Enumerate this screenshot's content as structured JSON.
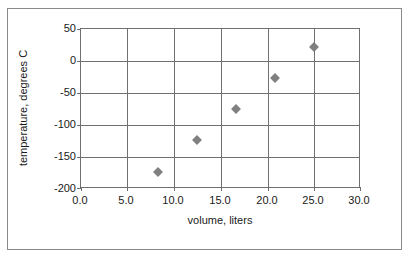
{
  "chart_data": {
    "type": "scatter",
    "title": "",
    "xlabel": "volume, liters",
    "ylabel": "temperature, degrees C",
    "xlim": [
      0.0,
      30.0
    ],
    "ylim": [
      -200,
      50
    ],
    "grid": true,
    "legend": "none",
    "marker_style": "diamond",
    "marker_color": "#808080",
    "x_ticks": [
      "0.0",
      "5.0",
      "10.0",
      "15.0",
      "20.0",
      "25.0",
      "30.0"
    ],
    "x_tick_values": [
      0.0,
      5.0,
      10.0,
      15.0,
      20.0,
      25.0,
      30.0
    ],
    "y_ticks": [
      "50",
      "0",
      "-50",
      "-100",
      "-150",
      "-200"
    ],
    "y_tick_values": [
      50,
      0,
      -50,
      -100,
      -150,
      -200
    ],
    "x": [
      8.3,
      12.5,
      16.7,
      20.9,
      25.1
    ],
    "y": [
      -176,
      -126,
      -77,
      -28,
      22
    ],
    "points": [
      {
        "x": 8.3,
        "y": -176
      },
      {
        "x": 12.5,
        "y": -126
      },
      {
        "x": 16.7,
        "y": -77
      },
      {
        "x": 20.9,
        "y": -28
      },
      {
        "x": 25.1,
        "y": 22
      }
    ]
  },
  "colors": {
    "marker": "#808080",
    "axis": "#6f6f6f",
    "grid": "#6f6f6f",
    "frame": "#8a8a8a",
    "text": "#1a1a1a",
    "background": "#ffffff"
  }
}
